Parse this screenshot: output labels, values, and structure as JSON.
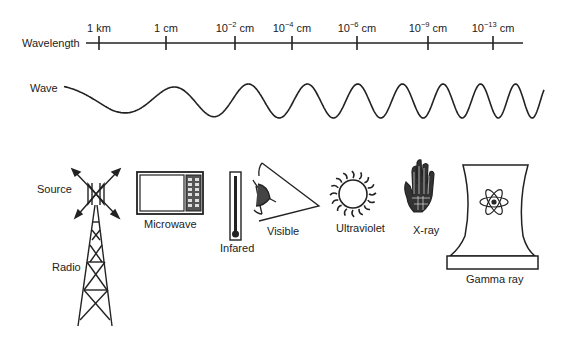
{
  "axis": {
    "label": "Wavelength",
    "ticks": [
      {
        "x": 99,
        "base": "1 km",
        "exp": "",
        "unit": ""
      },
      {
        "x": 166,
        "base": "1 cm",
        "exp": "",
        "unit": ""
      },
      {
        "x": 235,
        "base": "10",
        "exp": "−2",
        "unit": " cm"
      },
      {
        "x": 292,
        "base": "10",
        "exp": "−4",
        "unit": " cm"
      },
      {
        "x": 357,
        "base": "10",
        "exp": "−6",
        "unit": " cm"
      },
      {
        "x": 428,
        "base": "10",
        "exp": "−9",
        "unit": " cm"
      },
      {
        "x": 493,
        "base": "10",
        "exp": "−13",
        "unit": " cm"
      }
    ]
  },
  "wave": {
    "label": "Wave"
  },
  "sources": {
    "label": "Source",
    "items": [
      {
        "id": "radio",
        "label": "Radio",
        "icon": "radio-tower-icon"
      },
      {
        "id": "microwave",
        "label": "Microwave",
        "icon": "microwave-oven-icon"
      },
      {
        "id": "infrared",
        "label": "Infared",
        "icon": "thermometer-icon"
      },
      {
        "id": "visible",
        "label": "Visible",
        "icon": "eye-icon"
      },
      {
        "id": "ultraviolet",
        "label": "Ultraviolet",
        "icon": "sun-icon"
      },
      {
        "id": "xray",
        "label": "X-ray",
        "icon": "hand-xray-icon"
      },
      {
        "id": "gamma",
        "label": "Gamma ray",
        "icon": "nuclear-cooling-tower-icon"
      }
    ]
  },
  "colors": {
    "ink": "#222222",
    "background": "#ffffff"
  }
}
